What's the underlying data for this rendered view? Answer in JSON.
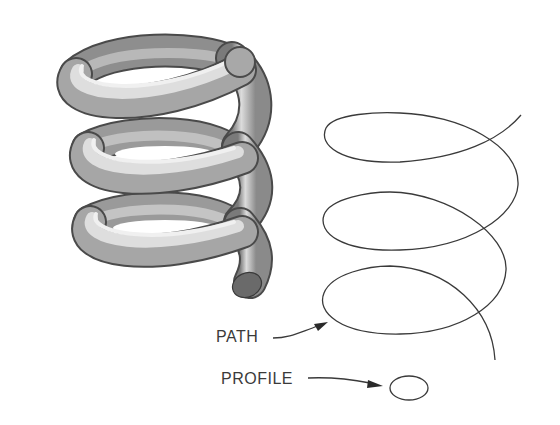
{
  "figure": {
    "labels": {
      "path": "PATH",
      "profile": "PROFILE"
    },
    "colors": {
      "line": "#3a3a3a",
      "tube_light": "#e8e8e8",
      "tube_mid": "#a8a8a8",
      "tube_dark": "#5a5a5a",
      "background": "#ffffff"
    }
  }
}
